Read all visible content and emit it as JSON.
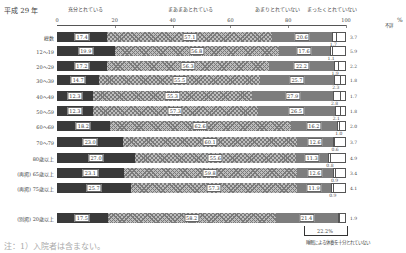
{
  "title": "平成 29 年",
  "legend": [
    {
      "label": "充分とれている",
      "x": 85
    },
    {
      "label": "まあまあとれている",
      "x": 190
    },
    {
      "label": "あまりとれていない",
      "x": 277
    },
    {
      "label": "まったくとれていない",
      "x": 332
    }
  ],
  "no_answer_label": "不詳",
  "pct_unit": "%",
  "note": "注：1）入院者は含まない。",
  "bracket": {
    "value": "22.2%",
    "label": "睡眠による休養を十分とれていない"
  },
  "chart_data": {
    "type": "bar",
    "orientation": "horizontal",
    "stacked": true,
    "title": "平成 29 年",
    "xlabel": "%",
    "xlim": [
      0,
      100
    ],
    "xticks": [
      "0",
      "20",
      "40",
      "60",
      "80",
      "100"
    ],
    "legend": [
      "充分とれている",
      "まあまあとれている",
      "あまりとれていない",
      "まったくとれていない",
      "不詳"
    ],
    "series_colors": [
      "#3a3a3a",
      "#bdbdbd",
      "#7d7d7d",
      "#ffffff",
      "#ffffff"
    ],
    "categories": [
      "総数",
      "12～19",
      "20～29",
      "30～39",
      "40～49",
      "50～59",
      "60～69",
      "70～79",
      "80歳以上",
      "(再掲) 65歳以上",
      "(再掲) 75歳以上",
      "(別掲) 20歳以上"
    ],
    "rows": [
      {
        "label": "総数",
        "values": [
          17.4,
          57.1,
          20.6,
          1.7,
          3.2
        ],
        "small": "1.7",
        "side": "3.7"
      },
      {
        "label": "12～19",
        "values": [
          19.9,
          56.8,
          17.6,
          1.1,
          4.6
        ],
        "small": "1.1",
        "side": "5.9"
      },
      {
        "label": "20～29",
        "values": [
          17.2,
          56.3,
          22.2,
          1.9,
          2.4
        ],
        "small": "1.9",
        "side": "2.2"
      },
      {
        "label": "30～39",
        "values": [
          14.7,
          55.5,
          25.7,
          2.3,
          1.8
        ],
        "small": "2.3",
        "side": "1.8"
      },
      {
        "label": "40～49",
        "values": [
          12.3,
          55.3,
          27.9,
          2.8,
          1.7
        ],
        "small": "2.8",
        "side": "1.7"
      },
      {
        "label": "50～59",
        "values": [
          12.3,
          57.3,
          26.5,
          2.1,
          1.8
        ],
        "small": "2.1",
        "side": "1.8"
      },
      {
        "label": "60～69",
        "values": [
          18.2,
          62.6,
          16.2,
          1.0,
          2.0
        ],
        "small": "1.0",
        "side": "2.0"
      },
      {
        "label": "70～79",
        "values": [
          23.0,
          60.1,
          12.6,
          0.6,
          3.7
        ],
        "small": "0.6",
        "side": "3.7"
      },
      {
        "label": "80歳以上",
        "values": [
          27.0,
          55.6,
          11.3,
          0.8,
          5.3
        ],
        "small": "0.8",
        "side": "4.9"
      },
      {
        "label": "(再掲) 65歳以上",
        "values": [
          23.1,
          59.8,
          12.6,
          0.9,
          3.6
        ],
        "small": "0.9",
        "side": "3.4"
      },
      {
        "label": "(再掲) 75歳以上",
        "values": [
          25.7,
          57.3,
          11.9,
          0.9,
          4.2
        ],
        "small": "0.9",
        "side": "4.1"
      },
      {
        "label": "(別掲) 20歳以上",
        "values": [
          17.5,
          58.2,
          21.4,
          1.0,
          1.9
        ],
        "small": "",
        "side": "1.9"
      }
    ]
  }
}
